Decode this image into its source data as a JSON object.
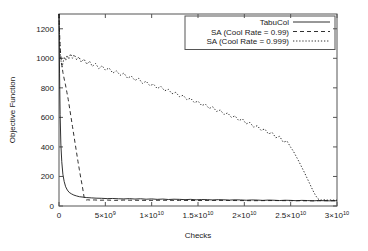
{
  "chart_data": {
    "type": "line",
    "title": "",
    "xlabel": "Checks",
    "ylabel": "Objective Function",
    "xlim": [
      0,
      30000000000
    ],
    "ylim": [
      0,
      1300
    ],
    "grid": false,
    "legend_position": "top-right",
    "xticks": [
      {
        "value": 0,
        "label": "0"
      },
      {
        "value": 5000000000,
        "label": "5×10",
        "exp": "9"
      },
      {
        "value": 10000000000,
        "label": "1×10",
        "exp": "10"
      },
      {
        "value": 15000000000,
        "label": "1.5×10",
        "exp": "10"
      },
      {
        "value": 20000000000,
        "label": "2×10",
        "exp": "10"
      },
      {
        "value": 25000000000,
        "label": "2.5×10",
        "exp": "10"
      },
      {
        "value": 30000000000,
        "label": "3×10",
        "exp": "10"
      }
    ],
    "yticks": [
      {
        "value": 0,
        "label": "0"
      },
      {
        "value": 200,
        "label": "200"
      },
      {
        "value": 400,
        "label": "400"
      },
      {
        "value": 600,
        "label": "600"
      },
      {
        "value": 800,
        "label": "800"
      },
      {
        "value": 1000,
        "label": "1000"
      },
      {
        "value": 1200,
        "label": "1200"
      }
    ],
    "series": [
      {
        "name": "TabuCol",
        "style": "solid",
        "color": "#1a1a1a",
        "points": [
          [
            0,
            1300
          ],
          [
            60000000,
            900
          ],
          [
            120000000,
            620
          ],
          [
            200000000,
            420
          ],
          [
            300000000,
            300
          ],
          [
            420000000,
            215
          ],
          [
            560000000,
            165
          ],
          [
            720000000,
            130
          ],
          [
            900000000,
            108
          ],
          [
            1100000000,
            92
          ],
          [
            1350000000,
            82
          ],
          [
            1600000000,
            74
          ],
          [
            1900000000,
            68
          ],
          [
            2200000000,
            63
          ],
          [
            2600000000,
            60
          ],
          [
            3000000000,
            57
          ],
          [
            3500000000,
            55
          ],
          [
            4000000000,
            53
          ],
          [
            4600000000,
            52
          ],
          [
            5200000000,
            50
          ],
          [
            5800000000,
            51
          ],
          [
            6400000000,
            49
          ],
          [
            7000000000,
            48
          ],
          [
            7600000000,
            50
          ],
          [
            8200000000,
            47
          ],
          [
            8800000000,
            49
          ],
          [
            9400000000,
            46
          ],
          [
            10000000000,
            48
          ],
          [
            10600000000,
            45
          ],
          [
            11200000000,
            47
          ],
          [
            11800000000,
            44
          ],
          [
            12400000000,
            46
          ],
          [
            13000000000,
            45
          ],
          [
            13600000000,
            43
          ],
          [
            14200000000,
            45
          ],
          [
            14800000000,
            42
          ],
          [
            15400000000,
            44
          ],
          [
            16000000000,
            43
          ],
          [
            16600000000,
            41
          ],
          [
            17200000000,
            43
          ],
          [
            17800000000,
            42
          ],
          [
            18400000000,
            40
          ],
          [
            19000000000,
            42
          ],
          [
            19600000000,
            41
          ],
          [
            20200000000,
            39
          ],
          [
            20800000000,
            41
          ],
          [
            21400000000,
            40
          ],
          [
            22000000000,
            38
          ],
          [
            22600000000,
            40
          ],
          [
            23200000000,
            39
          ],
          [
            23800000000,
            37
          ],
          [
            24400000000,
            39
          ],
          [
            25000000000,
            38
          ],
          [
            25600000000,
            36
          ],
          [
            26200000000,
            38
          ],
          [
            26800000000,
            37
          ],
          [
            27400000000,
            35
          ],
          [
            28000000000,
            37
          ],
          [
            28600000000,
            36
          ],
          [
            29200000000,
            35
          ],
          [
            29800000000,
            36
          ],
          [
            30000000000,
            35
          ]
        ]
      },
      {
        "name": "SA (Cool Rate = 0.99)",
        "style": "dashed",
        "color": "#1a1a1a",
        "points": [
          [
            0,
            1300
          ],
          [
            50000000,
            1190
          ],
          [
            120000000,
            1080
          ],
          [
            200000000,
            1010
          ],
          [
            300000000,
            960
          ],
          [
            420000000,
            905
          ],
          [
            560000000,
            860
          ],
          [
            700000000,
            820
          ],
          [
            850000000,
            770
          ],
          [
            1000000000,
            720
          ],
          [
            1150000000,
            660
          ],
          [
            1300000000,
            600
          ],
          [
            1450000000,
            540
          ],
          [
            1600000000,
            480
          ],
          [
            1750000000,
            420
          ],
          [
            1900000000,
            360
          ],
          [
            2050000000,
            300
          ],
          [
            2200000000,
            245
          ],
          [
            2350000000,
            190
          ],
          [
            2500000000,
            140
          ],
          [
            2620000000,
            95
          ],
          [
            2700000000,
            62
          ],
          [
            2780000000,
            45
          ],
          [
            2900000000,
            40
          ],
          [
            3100000000,
            42
          ],
          [
            3400000000,
            40
          ],
          [
            3800000000,
            41
          ],
          [
            4400000000,
            39
          ],
          [
            5200000000,
            40
          ],
          [
            6000000000,
            38
          ],
          [
            7000000000,
            40
          ],
          [
            8000000000,
            39
          ],
          [
            9500000000,
            38
          ],
          [
            11000000000,
            39
          ],
          [
            13000000000,
            38
          ],
          [
            15000000000,
            37
          ],
          [
            17000000000,
            38
          ],
          [
            19000000000,
            37
          ],
          [
            21000000000,
            36
          ],
          [
            23000000000,
            37
          ],
          [
            25000000000,
            36
          ],
          [
            27000000000,
            35
          ],
          [
            29000000000,
            36
          ],
          [
            30000000000,
            35
          ]
        ]
      },
      {
        "name": "SA (Cool Rate = 0.999)",
        "style": "dotted",
        "color": "#1a1a1a",
        "points": [
          [
            0,
            1300
          ],
          [
            60000000,
            1140
          ],
          [
            140000000,
            1030
          ],
          [
            230000000,
            975
          ],
          [
            330000000,
            940
          ],
          [
            450000000,
            975
          ],
          [
            580000000,
            1010
          ],
          [
            720000000,
            985
          ],
          [
            880000000,
            1020
          ],
          [
            1050000000,
            995
          ],
          [
            1250000000,
            1030
          ],
          [
            1450000000,
            1000
          ],
          [
            1650000000,
            1025
          ],
          [
            1900000000,
            990
          ],
          [
            2150000000,
            1010
          ],
          [
            2400000000,
            975
          ],
          [
            2700000000,
            995
          ],
          [
            3000000000,
            960
          ],
          [
            3300000000,
            980
          ],
          [
            3600000000,
            945
          ],
          [
            3950000000,
            965
          ],
          [
            4300000000,
            930
          ],
          [
            4650000000,
            950
          ],
          [
            5000000000,
            920
          ],
          [
            5400000000,
            935
          ],
          [
            5800000000,
            900
          ],
          [
            6200000000,
            915
          ],
          [
            6600000000,
            885
          ],
          [
            7000000000,
            900
          ],
          [
            7400000000,
            865
          ],
          [
            7800000000,
            880
          ],
          [
            8200000000,
            850
          ],
          [
            8600000000,
            865
          ],
          [
            9000000000,
            830
          ],
          [
            9400000000,
            845
          ],
          [
            9800000000,
            815
          ],
          [
            10200000000,
            825
          ],
          [
            10600000000,
            795
          ],
          [
            11000000000,
            810
          ],
          [
            11400000000,
            780
          ],
          [
            11800000000,
            790
          ],
          [
            12200000000,
            760
          ],
          [
            12600000000,
            770
          ],
          [
            13000000000,
            740
          ],
          [
            13400000000,
            750
          ],
          [
            13800000000,
            720
          ],
          [
            14200000000,
            730
          ],
          [
            14600000000,
            700
          ],
          [
            15000000000,
            710
          ],
          [
            15400000000,
            680
          ],
          [
            15800000000,
            690
          ],
          [
            16200000000,
            660
          ],
          [
            16600000000,
            672
          ],
          [
            17000000000,
            640
          ],
          [
            17400000000,
            650
          ],
          [
            17800000000,
            620
          ],
          [
            18200000000,
            630
          ],
          [
            18600000000,
            600
          ],
          [
            19000000000,
            610
          ],
          [
            19400000000,
            578
          ],
          [
            19800000000,
            590
          ],
          [
            20200000000,
            556
          ],
          [
            20600000000,
            566
          ],
          [
            21000000000,
            534
          ],
          [
            21400000000,
            544
          ],
          [
            21800000000,
            512
          ],
          [
            22200000000,
            522
          ],
          [
            22600000000,
            488
          ],
          [
            23000000000,
            498
          ],
          [
            23400000000,
            462
          ],
          [
            23800000000,
            472
          ],
          [
            24200000000,
            432
          ],
          [
            24600000000,
            440
          ],
          [
            25000000000,
            398
          ],
          [
            25300000000,
            370
          ],
          [
            25600000000,
            335
          ],
          [
            25900000000,
            300
          ],
          [
            26200000000,
            262
          ],
          [
            26500000000,
            225
          ],
          [
            26800000000,
            185
          ],
          [
            27100000000,
            145
          ],
          [
            27400000000,
            105
          ],
          [
            27700000000,
            70
          ],
          [
            27950000000,
            48
          ],
          [
            28200000000,
            40
          ],
          [
            28600000000,
            42
          ],
          [
            29000000000,
            40
          ],
          [
            29400000000,
            41
          ],
          [
            29800000000,
            39
          ],
          [
            30000000000,
            40
          ]
        ]
      }
    ]
  }
}
